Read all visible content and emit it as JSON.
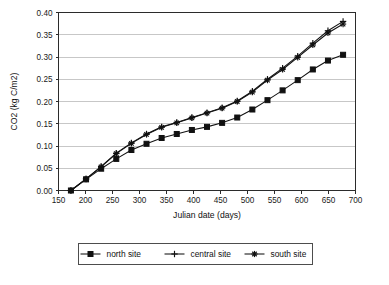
{
  "chart_data": {
    "type": "line",
    "title": "",
    "xlabel": "Julian date (days)",
    "ylabel": "CO2 (kg C/m2)",
    "xlim": [
      150,
      700
    ],
    "ylim": [
      0.0,
      0.4
    ],
    "xticks": [
      150,
      200,
      250,
      300,
      350,
      400,
      450,
      500,
      550,
      600,
      650,
      700
    ],
    "yticks": [
      0.0,
      0.05,
      0.1,
      0.15,
      0.2,
      0.25,
      0.3,
      0.35,
      0.4
    ],
    "xtick_labels": [
      "150",
      "200",
      "250",
      "300",
      "350",
      "400",
      "450",
      "500",
      "550",
      "600",
      "650",
      "700"
    ],
    "ytick_labels": [
      "0.00",
      "0.05",
      "0.10",
      "0.15",
      "0.20",
      "0.25",
      "0.30",
      "0.35",
      "0.40"
    ],
    "grid": "horizontal",
    "legend_position": "bottom",
    "x": [
      173,
      201,
      229,
      257,
      285,
      313,
      341,
      369,
      397,
      425,
      453,
      481,
      509,
      537,
      565,
      593,
      621,
      649,
      677
    ],
    "series": [
      {
        "name": "north site",
        "marker": "square",
        "values": [
          0.0,
          0.025,
          0.049,
          0.071,
          0.091,
          0.105,
          0.118,
          0.127,
          0.136,
          0.143,
          0.152,
          0.164,
          0.182,
          0.203,
          0.225,
          0.248,
          0.272,
          0.292,
          0.305
        ]
      },
      {
        "name": "central site",
        "marker": "cross",
        "values": [
          0.0,
          0.026,
          0.054,
          0.084,
          0.107,
          0.127,
          0.143,
          0.153,
          0.164,
          0.175,
          0.186,
          0.201,
          0.223,
          0.25,
          0.275,
          0.302,
          0.331,
          0.359,
          0.38
        ]
      },
      {
        "name": "south site",
        "marker": "star",
        "values": [
          0.0,
          0.026,
          0.053,
          0.083,
          0.106,
          0.126,
          0.142,
          0.152,
          0.163,
          0.174,
          0.185,
          0.2,
          0.221,
          0.248,
          0.272,
          0.299,
          0.327,
          0.354,
          0.374
        ]
      }
    ]
  },
  "legend": {
    "items": [
      {
        "label": "north site"
      },
      {
        "label": "central site"
      },
      {
        "label": "south site"
      }
    ]
  },
  "axes": {
    "x_title": "Julian date (days)",
    "y_title": "CO2 (kg C/m2)"
  },
  "colors": {
    "ink": "#111111",
    "grid": "#b9b9b9",
    "axis": "#2b2b2b",
    "background": "#ffffff"
  }
}
